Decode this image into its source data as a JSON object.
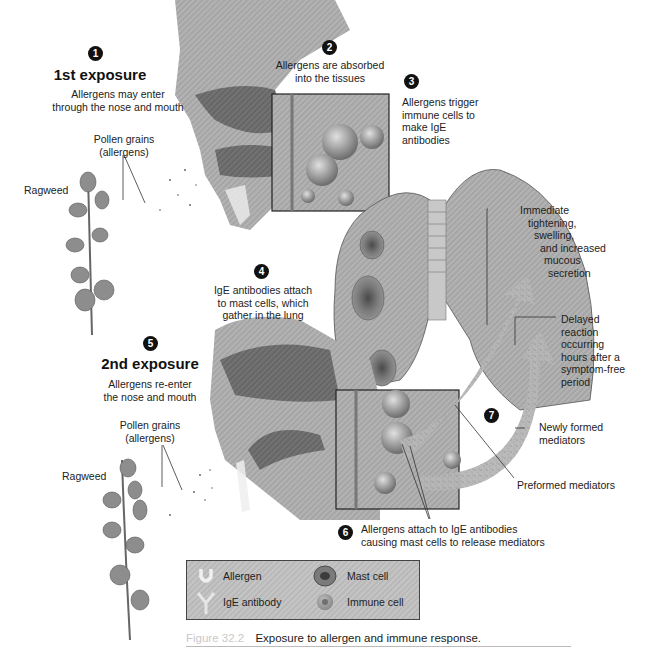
{
  "steps": {
    "s1": {
      "number": "1",
      "title": "1st exposure",
      "text": [
        "Allergens may enter",
        "through the nose and mouth"
      ]
    },
    "s2": {
      "number": "2",
      "text": [
        "Allergens are absorbed",
        "into the tissues"
      ]
    },
    "s3": {
      "number": "3",
      "text": [
        "Allergens trigger",
        "immune cells to",
        "make IgE",
        "antibodies"
      ]
    },
    "s4": {
      "number": "4",
      "text": [
        "IgE antibodies attach",
        "to mast cells, which",
        "gather in the lung"
      ]
    },
    "s5": {
      "number": "5",
      "title": "2nd exposure",
      "text": [
        "Allergens re-enter",
        "the nose and mouth"
      ]
    },
    "s6": {
      "number": "6",
      "text": [
        "Allergens attach to IgE antibodies",
        "causing mast cells to release mediators"
      ]
    },
    "s7": {
      "number": "7"
    }
  },
  "labels": {
    "pollen1": [
      "Pollen grains",
      "(allergens)"
    ],
    "ragweed1": "Ragweed",
    "pollen2": [
      "Pollen grains",
      "(allergens)"
    ],
    "ragweed2": "Ragweed",
    "immediate": [
      "Immediate",
      "tightening,",
      "swelling,",
      "and increased",
      "mucous",
      "secretion"
    ],
    "delayed": [
      "Delayed",
      "reaction",
      "occurring",
      "hours after a",
      "symptom-free",
      "period"
    ],
    "newly_formed": [
      "Newly formed",
      "mediators"
    ],
    "preformed": "Preformed mediators"
  },
  "legend": {
    "allergen": "Allergen",
    "ige_antibody": "IgE antibody",
    "mast_cell": "Mast cell",
    "immune_cell": "Immune cell"
  },
  "caption": {
    "figure": "Figure 32.2",
    "text": "Exposure to allergen and immune response."
  },
  "colors": {
    "tissue": "#a9a9a9",
    "tissue_dark": "#6e6e6e",
    "lung": "#9a9a9a",
    "leaf": "#8a8a8a",
    "badge": "#111111"
  }
}
